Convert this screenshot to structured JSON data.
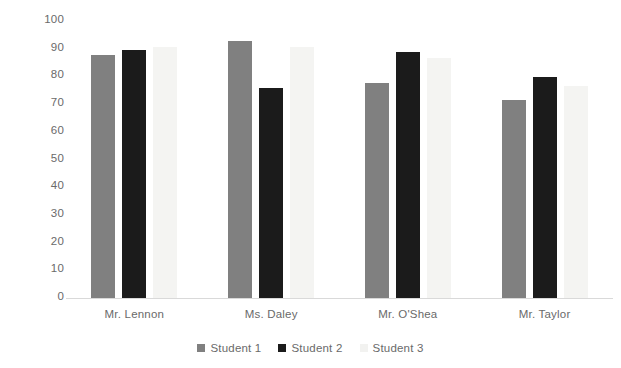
{
  "chart_data": {
    "type": "bar",
    "title": "",
    "subtitle": "",
    "xlabel": "",
    "ylabel": "",
    "ylim": [
      0,
      100
    ],
    "ytick_step": 10,
    "yticks": [
      100,
      90,
      80,
      70,
      60,
      50,
      40,
      30,
      20,
      10,
      0
    ],
    "grid": false,
    "legend_position": "bottom",
    "categories": [
      "Mr. Lennon",
      "Ms. Daley",
      "Mr. O'Shea",
      "Mr. Taylor"
    ],
    "series": [
      {
        "name": "Student 1",
        "color": "#808080",
        "values": [
          88,
          93,
          78,
          72
        ]
      },
      {
        "name": "Student 2",
        "color": "#1b1b1b",
        "values": [
          90,
          76,
          89,
          80
        ]
      },
      {
        "name": "Student 3",
        "color": "#f4f4f2",
        "values": [
          91,
          91,
          87,
          77
        ]
      }
    ]
  },
  "axis": {
    "tick_100": "100",
    "tick_90": "90",
    "tick_80": "80",
    "tick_70": "70",
    "tick_60": "60",
    "tick_50": "50",
    "tick_40": "40",
    "tick_30": "30",
    "tick_20": "20",
    "tick_10": "10",
    "tick_0": "0"
  },
  "categories": {
    "c0": "Mr. Lennon",
    "c1": "Ms. Daley",
    "c2": "Mr. O'Shea",
    "c3": "Mr. Taylor"
  },
  "legend": {
    "items": [
      {
        "label": "Student 1"
      },
      {
        "label": "Student 2"
      },
      {
        "label": "Student 3"
      }
    ]
  }
}
